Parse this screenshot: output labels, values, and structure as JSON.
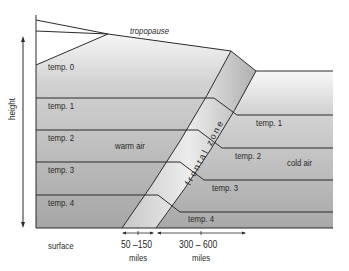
{
  "diagram": {
    "labels": {
      "tropopause": "tropopause",
      "warm_air": "warm air",
      "cold_air": "cold air",
      "frontal_zone": "frontal zone",
      "height_axis": "height",
      "surface": "surface"
    },
    "warm_side_layers": [
      "temp. 0",
      "temp. 1",
      "temp. 2",
      "temp. 3",
      "temp. 4"
    ],
    "cold_side_layers": [
      "temp. 1",
      "temp. 2",
      "temp. 3",
      "temp. 4"
    ],
    "distances": [
      {
        "value": "50 –150",
        "unit": "miles"
      },
      {
        "value": "300 – 600",
        "unit": "miles"
      }
    ],
    "colors": {
      "line": "#2b2b2b",
      "fill_light": "#f4f4f4",
      "fill_dark": "#a9a9a9",
      "zone_light": "#e6e6e6",
      "zone_dark": "#b5b5b5"
    }
  }
}
